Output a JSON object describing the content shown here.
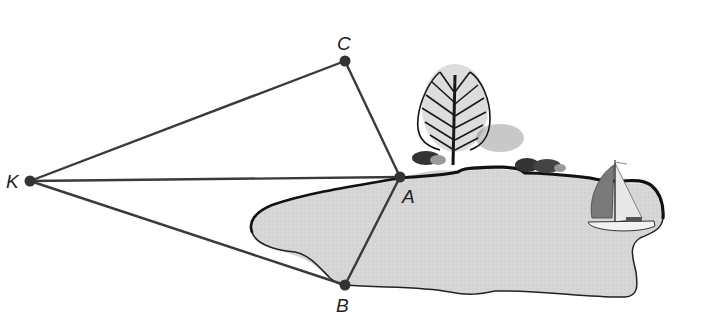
{
  "diagram": {
    "type": "geometry-survey-figure",
    "points": {
      "K": {
        "label": "K",
        "x": 30,
        "y": 181
      },
      "C": {
        "label": "C",
        "x": 345,
        "y": 61
      },
      "A": {
        "label": "A",
        "x": 400,
        "y": 177
      },
      "B": {
        "label": "B",
        "x": 345,
        "y": 285
      }
    },
    "segments": [
      {
        "from": "K",
        "to": "C"
      },
      {
        "from": "C",
        "to": "A"
      },
      {
        "from": "K",
        "to": "A"
      },
      {
        "from": "K",
        "to": "B"
      },
      {
        "from": "A",
        "to": "B"
      }
    ],
    "scenery": {
      "lake": "gray-filled-lake",
      "tree": "deciduous-tree",
      "bushes": 2,
      "boat": "sailboat"
    },
    "colors": {
      "line": "#3a3a3a",
      "point": "#333333",
      "lake_fill": "#d4d4d4",
      "shore": "#111111",
      "shadow": "#bdbdbd"
    }
  }
}
